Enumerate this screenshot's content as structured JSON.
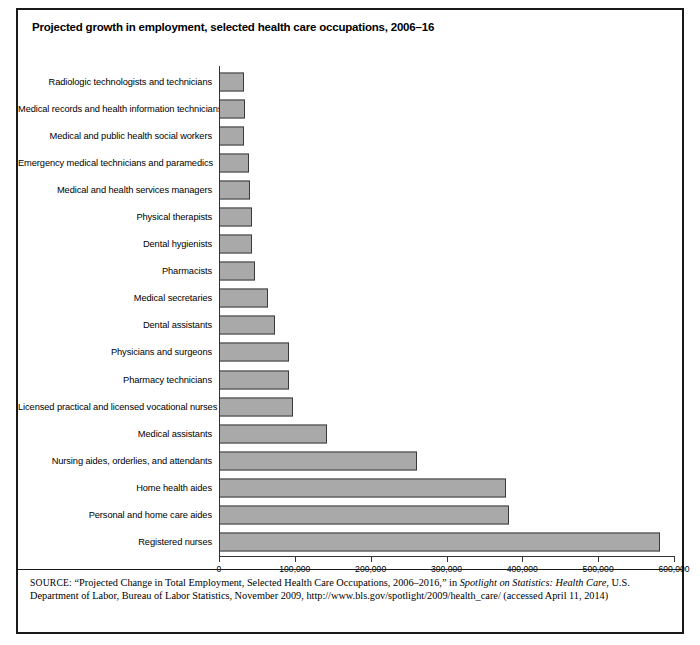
{
  "figure": {
    "title": "Projected growth in employment, selected health care occupations, 2006–16",
    "source_label": "SOURCE:",
    "source_part1": "“Projected Change in Total Employment, Selected Health Care Occupations, 2006–2016,” in ",
    "source_italic": "Spotlight on Statistics: Health Care",
    "source_part2": ", U.S. Department of Labor, Bureau of Labor Statistics, November 2009, http://www.bls.gov/spotlight/2009/health_care/ (accessed April 11, 2014)"
  },
  "chart_data": {
    "type": "bar",
    "orientation": "horizontal",
    "title": "Projected growth in employment, selected health care occupations, 2006–16",
    "xlabel": "",
    "ylabel": "",
    "xlim": [
      0,
      600000
    ],
    "grid": false,
    "legend": "none",
    "bar_color": "#a9a9a9",
    "bar_border_color": "#3a3a3a",
    "tick_labels": [
      "0",
      "100,000",
      "200,000",
      "300,000",
      "400,000",
      "500,000",
      "600,000"
    ],
    "ticks": [
      0,
      100000,
      200000,
      300000,
      400000,
      500000,
      600000
    ],
    "categories": [
      "Radiologic technologists and technicians",
      "Medical records and health information technicians",
      "Medical and public health social workers",
      "Emergency medical technicians and paramedics",
      "Medical and health services managers",
      "Physical therapists",
      "Dental hygienists",
      "Pharmacists",
      "Medical secretaries",
      "Dental assistants",
      "Physicians and surgeons",
      "Pharmacy technicians",
      "Licensed practical and licensed vocational nurses",
      "Medical assistants",
      "Nursing aides, orderlies, and attendants",
      "Home health aides",
      "Personal and home care aides",
      "Registered nurses"
    ],
    "values": [
      33000,
      34000,
      33000,
      39000,
      41000,
      44000,
      44000,
      48000,
      64000,
      74000,
      92000,
      92000,
      98000,
      143000,
      261000,
      378000,
      382000,
      582000
    ]
  }
}
